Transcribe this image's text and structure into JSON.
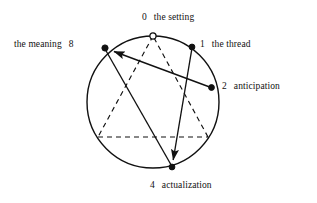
{
  "figure": {
    "background": "#ffffff",
    "stroke_color": "#111111",
    "circle": {
      "cx": 153,
      "cy": 102,
      "r": 66
    }
  },
  "nodes": [
    {
      "id": "0",
      "number": "0",
      "name": "the setting",
      "x": 153,
      "y": 36,
      "filled": false,
      "label_side": "top"
    },
    {
      "id": "1",
      "number": "1",
      "name": "the thread",
      "x": 192,
      "y": 47,
      "filled": true,
      "label_side": "right"
    },
    {
      "id": "2",
      "number": "2",
      "name": "anticipation",
      "x": 212,
      "y": 88,
      "filled": true,
      "label_side": "right"
    },
    {
      "id": "4",
      "number": "4",
      "name": "actualization",
      "x": 172,
      "y": 167,
      "filled": true,
      "label_side": "bottom"
    },
    {
      "id": "8",
      "number": "8",
      "name": "the meaning",
      "x": 105,
      "y": 48,
      "filled": true,
      "label_side": "left"
    }
  ],
  "dashed_triangle": {
    "style": "dashed",
    "vertices": [
      {
        "id": "t0",
        "x": 153,
        "y": 36
      },
      {
        "id": "t3",
        "x": 98,
        "y": 137
      },
      {
        "id": "t6",
        "x": 208,
        "y": 137
      }
    ]
  },
  "arrows": [
    {
      "id": "a1",
      "from": "2",
      "to": "8",
      "from_x": 212,
      "from_y": 88,
      "to_x": 105,
      "to_y": 48,
      "arrowhead": "to"
    },
    {
      "id": "a2",
      "from": "1",
      "to": "4",
      "from_x": 192,
      "from_y": 47,
      "to_x": 172,
      "to_y": 167,
      "arrowhead": "to"
    },
    {
      "id": "a3",
      "from": "8",
      "to": "4",
      "from_x": 105,
      "from_y": 48,
      "to_x": 172,
      "to_y": 167,
      "arrowhead": "none"
    }
  ],
  "labels": {
    "n0": {
      "number": "0",
      "text": "the setting"
    },
    "n1": {
      "number": "1",
      "text": "the thread"
    },
    "n2": {
      "number": "2",
      "text": "anticipation"
    },
    "n4": {
      "number": "4",
      "text": "actualization"
    },
    "n8": {
      "number": "8",
      "text": "the meaning"
    }
  }
}
